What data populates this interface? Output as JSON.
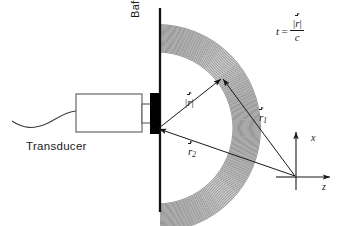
{
  "figure": {
    "type": "acoustic-transducer-radiation-diagram",
    "background_color": "#ffffff",
    "line_color": "#1a1a1a"
  },
  "labels": {
    "transducer": "Transducer",
    "baffle": "Baffle"
  },
  "axes": {
    "x_label": "x",
    "z_label": "z",
    "origin_px": [
      296,
      177
    ]
  },
  "vectors": [
    {
      "id": "r-magnitude",
      "symbol": "r",
      "display": "|r|",
      "has_overarrow": true,
      "has_magnitude_bars": true,
      "subscript": "",
      "from_px": [
        157,
        128
      ],
      "to_px": [
        222,
        77
      ]
    },
    {
      "id": "r1",
      "symbol": "r",
      "display": "r1",
      "has_overarrow": true,
      "has_magnitude_bars": false,
      "subscript": "1",
      "from_px": [
        296,
        177
      ],
      "to_px": [
        222,
        77
      ]
    },
    {
      "id": "r2",
      "symbol": "r",
      "display": "r2",
      "has_overarrow": true,
      "has_magnitude_bars": false,
      "subscript": "2",
      "from_px": [
        296,
        177
      ],
      "to_px": [
        157,
        128
      ]
    }
  ],
  "formula": {
    "lhs": "t",
    "equals": "=",
    "numerator": "|r|",
    "numerator_symbol": "r",
    "denominator": "c",
    "full_text": "t = |r| / c"
  },
  "components": {
    "transducer_body": {
      "name": "transducer-housing",
      "x": 76,
      "y": 94,
      "width": 66,
      "height": 38,
      "fill": "#ffffff",
      "stroke": "#555555"
    },
    "transducer_neck": {
      "name": "transducer-neck",
      "x": 142,
      "y": 104,
      "width": 8,
      "height": 19
    },
    "active_element": {
      "name": "piezo-element",
      "x": 150,
      "y": 93,
      "width": 10,
      "height": 41,
      "fill": "#000000"
    },
    "baffle_line": {
      "name": "baffle-plane",
      "x": 160,
      "y_top": 8,
      "y_bottom": 212,
      "stroke_width": 2.2
    },
    "cable": {
      "name": "transducer-cable",
      "path": "wavy"
    }
  },
  "wavefronts": {
    "count": 26,
    "description": "concentric circular arcs radiating from the transducer face",
    "center_px": [
      157,
      128
    ],
    "inner_radius": 76,
    "outer_radius": 104,
    "color": "#2b2b2b"
  }
}
